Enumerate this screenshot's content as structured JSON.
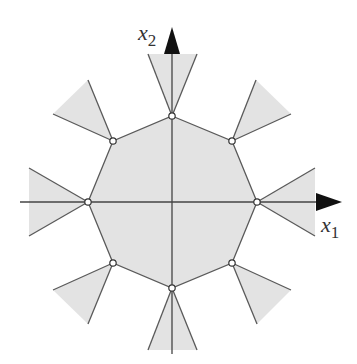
{
  "figure": {
    "axes": {
      "x_label": "x",
      "x_subscript": "1",
      "y_label": "x",
      "y_subscript": "2",
      "origin": [
        172,
        202
      ]
    },
    "colors": {
      "fill": "#e3e3e3",
      "stroke": "#5a5a5a",
      "axis": "#444444",
      "arrow": "#111111",
      "vertex_fill": "#ffffff"
    },
    "octagon_vertices": [
      [
        172,
        116
      ],
      [
        232,
        141
      ],
      [
        257,
        202
      ],
      [
        232,
        263
      ],
      [
        172,
        288
      ],
      [
        113,
        263
      ],
      [
        88,
        202
      ],
      [
        113,
        141
      ]
    ],
    "cones": [
      {
        "vertex": [
          172,
          116
        ],
        "p1": [
          148,
          54
        ],
        "p2": [
          197,
          54
        ]
      },
      {
        "vertex": [
          232,
          141
        ],
        "p1": [
          256,
          80
        ],
        "p2": [
          291,
          114
        ]
      },
      {
        "vertex": [
          257,
          202
        ],
        "p1": [
          315,
          168
        ],
        "p2": [
          315,
          236
        ]
      },
      {
        "vertex": [
          232,
          263
        ],
        "p1": [
          291,
          290
        ],
        "p2": [
          257,
          324
        ]
      },
      {
        "vertex": [
          172,
          288
        ],
        "p1": [
          197,
          350
        ],
        "p2": [
          148,
          350
        ]
      },
      {
        "vertex": [
          113,
          263
        ],
        "p1": [
          88,
          324
        ],
        "p2": [
          53,
          290
        ]
      },
      {
        "vertex": [
          88,
          202
        ],
        "p1": [
          29,
          236
        ],
        "p2": [
          29,
          168
        ]
      },
      {
        "vertex": [
          113,
          141
        ],
        "p1": [
          53,
          114
        ],
        "p2": [
          88,
          80
        ]
      }
    ]
  }
}
